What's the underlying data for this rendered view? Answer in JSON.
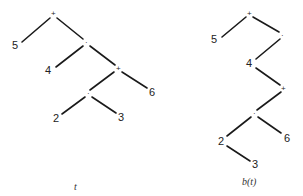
{
  "trees": [
    {
      "caption": "t",
      "nodes": [
        {
          "id": "n1",
          "label": "+",
          "kind": "op",
          "x": 53,
          "y": 14
        },
        {
          "id": "n2",
          "label": "5",
          "kind": "leaf",
          "x": 17,
          "y": 47
        },
        {
          "id": "n3",
          "label": "·",
          "kind": "op",
          "x": 86,
          "y": 42
        },
        {
          "id": "n4",
          "label": "4",
          "kind": "leaf",
          "x": 50,
          "y": 72
        },
        {
          "id": "n5",
          "label": "+",
          "kind": "op",
          "x": 118,
          "y": 68
        },
        {
          "id": "n6",
          "label": "·",
          "kind": "op",
          "x": 88,
          "y": 93
        },
        {
          "id": "n7",
          "label": "6",
          "kind": "leaf",
          "x": 152,
          "y": 93
        },
        {
          "id": "n8",
          "label": "2",
          "kind": "leaf",
          "x": 56,
          "y": 119
        },
        {
          "id": "n9",
          "label": "3",
          "kind": "leaf",
          "x": 121,
          "y": 118
        }
      ],
      "edges": [
        [
          "n1",
          "n2"
        ],
        [
          "n1",
          "n3"
        ],
        [
          "n3",
          "n4"
        ],
        [
          "n3",
          "n5"
        ],
        [
          "n5",
          "n6"
        ],
        [
          "n5",
          "n7"
        ],
        [
          "n6",
          "n8"
        ],
        [
          "n6",
          "n9"
        ]
      ]
    },
    {
      "caption": "b(t)",
      "nodes": [
        {
          "id": "m1",
          "label": "+",
          "kind": "op",
          "x": 249,
          "y": 14
        },
        {
          "id": "m2",
          "label": "5",
          "kind": "leaf",
          "x": 215,
          "y": 41
        },
        {
          "id": "m3",
          "label": "·",
          "kind": "op",
          "x": 282,
          "y": 35
        },
        {
          "id": "m4",
          "label": "4",
          "kind": "leaf",
          "x": 250,
          "y": 65
        },
        {
          "id": "m5",
          "label": "+",
          "kind": "op",
          "x": 283,
          "y": 88
        },
        {
          "id": "m6",
          "label": "·",
          "kind": "op",
          "x": 254,
          "y": 113
        },
        {
          "id": "m7",
          "label": "2",
          "kind": "leaf",
          "x": 221,
          "y": 142
        },
        {
          "id": "m8",
          "label": "6",
          "kind": "leaf",
          "x": 287,
          "y": 139
        },
        {
          "id": "m9",
          "label": "3",
          "kind": "leaf",
          "x": 255,
          "y": 165
        }
      ],
      "edges": [
        [
          "m1",
          "m2"
        ],
        [
          "m1",
          "m3"
        ],
        [
          "m3",
          "m4"
        ],
        [
          "m4",
          "m5"
        ],
        [
          "m5",
          "m6"
        ],
        [
          "m6",
          "m7"
        ],
        [
          "m6",
          "m8"
        ],
        [
          "m7",
          "m9"
        ]
      ]
    }
  ],
  "captions": {
    "left": "t",
    "right": "b(t)"
  }
}
